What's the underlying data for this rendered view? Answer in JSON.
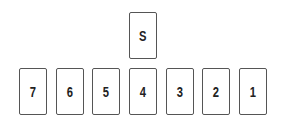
{
  "top_card": {
    "label": "S"
  },
  "row_cards": [
    {
      "label": "7"
    },
    {
      "label": "6"
    },
    {
      "label": "5"
    },
    {
      "label": "4"
    },
    {
      "label": "3"
    },
    {
      "label": "2"
    },
    {
      "label": "1"
    }
  ]
}
